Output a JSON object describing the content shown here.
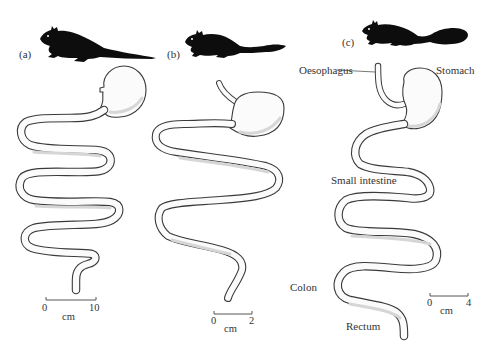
{
  "figure": {
    "panels": [
      {
        "id": "a",
        "label": "(a)",
        "animal": "rodent-silhouette-long-tail",
        "scale_bar": {
          "start": "0",
          "end": "10",
          "unit": "cm"
        }
      },
      {
        "id": "b",
        "label": "(b)",
        "animal": "rodent-silhouette-short-bushy-tail",
        "scale_bar": {
          "start": "0",
          "end": "2",
          "unit": "cm"
        }
      },
      {
        "id": "c",
        "label": "(c)",
        "animal": "rodent-silhouette-bushy-tail",
        "scale_bar": {
          "start": "0",
          "end": "4",
          "unit": "cm"
        },
        "annotations": {
          "oesophagus": "Oesophagus",
          "stomach": "Stomach",
          "small_intestine": "Small intestine",
          "colon": "Colon",
          "rectum": "Rectum"
        }
      }
    ],
    "colors": {
      "ink": "#0d0d0d",
      "outline": "#3a3a3a",
      "fill": "#fbfbfb",
      "background": "#ffffff"
    }
  }
}
